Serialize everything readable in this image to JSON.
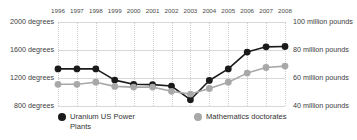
{
  "chart_data": {
    "type": "line",
    "title": "",
    "xlabel": "",
    "grid": true,
    "legend_position": "bottom",
    "categories": [
      "1996",
      "1997",
      "1998",
      "1999",
      "2000",
      "2001",
      "2002",
      "2003",
      "2004",
      "2005",
      "2006",
      "2007",
      "2008"
    ],
    "axes": {
      "left": {
        "label": "degrees",
        "ylim": [
          800,
          2000
        ],
        "ticks": [
          800,
          1200,
          1600,
          2000
        ],
        "tick_labels": [
          "800 degrees",
          "1200 degrees",
          "1600 degrees",
          "2000 degrees"
        ]
      },
      "right": {
        "label": "million pounds",
        "ylim": [
          40,
          100
        ],
        "ticks": [
          40,
          60,
          80,
          100
        ],
        "tick_labels": [
          "40 million pounds",
          "60 million pounds",
          "80 million pounds",
          "100 million pounds"
        ]
      }
    },
    "series": [
      {
        "name": "Uranium US Power Plants",
        "axis": "left",
        "color": "#1a1a1a",
        "marker": "circle",
        "values": [
          1330,
          1330,
          1330,
          1170,
          1110,
          1105,
          1085,
          890,
          1165,
          1330,
          1570,
          1645,
          1650
        ]
      },
      {
        "name": "Mathematics doctorates",
        "axis": "right",
        "color": "#a8a8a8",
        "marker": "circle",
        "values": [
          55.5,
          55.5,
          57.0,
          54.0,
          53.5,
          53.5,
          50.5,
          48.5,
          52.5,
          57.0,
          63.5,
          67.5,
          68.5
        ]
      }
    ]
  },
  "legend": {
    "entries": [
      {
        "label": "Uranium US Power\nPlants",
        "color": "#1a1a1a"
      },
      {
        "label": "Mathematics doctorates",
        "color": "#a8a8a8"
      }
    ]
  },
  "icons": {
    "legend_marker": "filled-circle-icon"
  }
}
